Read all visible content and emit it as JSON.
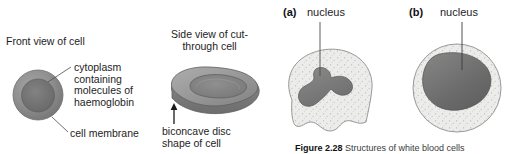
{
  "figure": {
    "caption_number": "Figure 2.28",
    "caption_text": " Structures of white blood cells"
  },
  "red_blood_cell": {
    "front_view": {
      "heading": "Front view of cell",
      "labels": {
        "cytoplasm": "cytoplasm\ncontaining\nmolecules of\nhaemoglobin",
        "cell_membrane": "cell membrane"
      },
      "colors": {
        "membrane_ring": "#8c8c8c",
        "cytoplasm_fill": "#707070",
        "outline": "#6e6e6e"
      }
    },
    "side_view": {
      "heading": "Side view of cut-\nthrough cell",
      "labels": {
        "shape": "biconcave disc\nshape of cell"
      },
      "colors": {
        "body_fill": "#9a9a9a",
        "body_shadow": "#7d7d7d",
        "concave_fill": "#8a8a8a",
        "outline": "#5e5e5e"
      }
    }
  },
  "white_blood_cells": [
    {
      "tag": "(a)",
      "title": "nucleus",
      "shape": "lobed-nucleus-cell",
      "colors": {
        "cytoplasm_fill": "#ececeb",
        "nucleus_fill": "#7c7c7c",
        "outline": "#8d8d8d",
        "stipple": "#b9b9b9"
      }
    },
    {
      "tag": "(b)",
      "title": "nucleus",
      "shape": "round-cell-bean-nucleus",
      "colors": {
        "cytoplasm_fill": "#ececeb",
        "nucleus_fill": "#6f6f6f",
        "outline": "#8d8d8d",
        "stipple": "#b9b9b9"
      }
    }
  ],
  "leader_lines": {
    "color": "#4d4d4d",
    "arrow_color": "#1a1a1a"
  }
}
